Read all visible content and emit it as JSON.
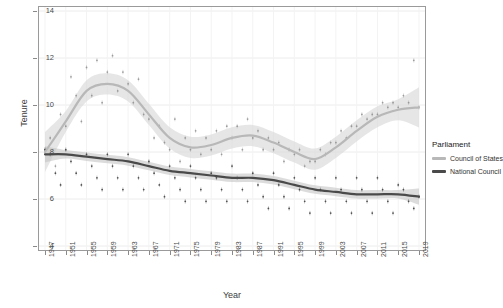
{
  "chart_data": {
    "type": "line",
    "title": "",
    "xlabel": "Year",
    "ylabel": "Tenure",
    "ylim": [
      4,
      14
    ],
    "xlim": [
      1947,
      2019
    ],
    "grid": true,
    "legend_position": "right",
    "legend_title": "Parliament",
    "y_ticks": [
      "4",
      "6",
      "8",
      "10",
      "12",
      "14"
    ],
    "x_ticks": [
      "1947",
      "1951",
      "1955",
      "1959",
      "1963",
      "1967",
      "1971",
      "1975",
      "1979",
      "1983",
      "1987",
      "1991",
      "1995",
      "1999",
      "2003",
      "2007",
      "2011",
      "2015",
      "2019"
    ],
    "series": [
      {
        "name": "Council of States",
        "color": "#b8b8b8",
        "band_color": "#d8d8d8",
        "x": [
          1947,
          1951,
          1955,
          1959,
          1963,
          1967,
          1971,
          1975,
          1979,
          1983,
          1987,
          1991,
          1995,
          1999,
          2003,
          2007,
          2011,
          2015,
          2019
        ],
        "values": [
          8.0,
          9.3,
          10.6,
          10.9,
          10.6,
          9.6,
          8.6,
          8.2,
          8.3,
          8.6,
          8.7,
          8.4,
          8.0,
          7.7,
          8.2,
          8.9,
          9.5,
          9.8,
          9.9
        ]
      },
      {
        "name": "National Council",
        "color": "#4a4a4a",
        "band_color": "#c0c0c0",
        "x": [
          1947,
          1951,
          1955,
          1959,
          1963,
          1967,
          1971,
          1975,
          1979,
          1983,
          1987,
          1991,
          1995,
          1999,
          2003,
          2007,
          2011,
          2015,
          2019
        ],
        "values": [
          7.9,
          7.9,
          7.8,
          7.7,
          7.6,
          7.4,
          7.2,
          7.1,
          7.0,
          6.9,
          6.9,
          6.8,
          6.6,
          6.4,
          6.3,
          6.2,
          6.2,
          6.2,
          6.1
        ]
      }
    ],
    "scatter": [
      {
        "series": "Council of States",
        "points": [
          [
            1947,
            8.1
          ],
          [
            1948,
            8.6
          ],
          [
            1949,
            7.4
          ],
          [
            1950,
            9.6
          ],
          [
            1951,
            9.1
          ],
          [
            1952,
            11.2
          ],
          [
            1953,
            10.4
          ],
          [
            1954,
            9.3
          ],
          [
            1955,
            11.6
          ],
          [
            1956,
            10.4
          ],
          [
            1957,
            11.9
          ],
          [
            1958,
            10.1
          ],
          [
            1959,
            11.4
          ],
          [
            1960,
            12.1
          ],
          [
            1961,
            10.6
          ],
          [
            1962,
            11.4
          ],
          [
            1963,
            10.9
          ],
          [
            1964,
            10.1
          ],
          [
            1965,
            11.1
          ],
          [
            1966,
            9.6
          ],
          [
            1967,
            9.4
          ],
          [
            1968,
            8.6
          ],
          [
            1969,
            9.1
          ],
          [
            1970,
            8.4
          ],
          [
            1971,
            8.1
          ],
          [
            1972,
            9.4
          ],
          [
            1973,
            7.6
          ],
          [
            1974,
            8.6
          ],
          [
            1975,
            8.1
          ],
          [
            1976,
            8.9
          ],
          [
            1977,
            7.9
          ],
          [
            1978,
            8.6
          ],
          [
            1979,
            8.1
          ],
          [
            1980,
            8.9
          ],
          [
            1981,
            7.9
          ],
          [
            1982,
            9.1
          ],
          [
            1983,
            8.6
          ],
          [
            1984,
            9.1
          ],
          [
            1985,
            8.1
          ],
          [
            1986,
            9.4
          ],
          [
            1987,
            8.6
          ],
          [
            1988,
            8.9
          ],
          [
            1989,
            8.1
          ],
          [
            1990,
            8.6
          ],
          [
            1991,
            8.1
          ],
          [
            1992,
            8.4
          ],
          [
            1993,
            7.6
          ],
          [
            1994,
            8.1
          ],
          [
            1995,
            7.9
          ],
          [
            1996,
            8.1
          ],
          [
            1997,
            7.4
          ],
          [
            1998,
            7.6
          ],
          [
            1999,
            7.6
          ],
          [
            2000,
            8.1
          ],
          [
            2001,
            7.9
          ],
          [
            2002,
            8.4
          ],
          [
            2003,
            8.4
          ],
          [
            2004,
            8.9
          ],
          [
            2005,
            8.6
          ],
          [
            2006,
            9.1
          ],
          [
            2007,
            9.1
          ],
          [
            2008,
            9.6
          ],
          [
            2009,
            9.4
          ],
          [
            2010,
            9.6
          ],
          [
            2011,
            9.6
          ],
          [
            2012,
            10.1
          ],
          [
            2013,
            9.9
          ],
          [
            2014,
            10.1
          ],
          [
            2015,
            9.9
          ],
          [
            2016,
            10.4
          ],
          [
            2017,
            10.1
          ],
          [
            2018,
            11.9
          ],
          [
            2019,
            9.9
          ]
        ]
      },
      {
        "series": "National Council",
        "points": [
          [
            1947,
            8.1
          ],
          [
            1948,
            7.9
          ],
          [
            1949,
            7.1
          ],
          [
            1950,
            6.6
          ],
          [
            1951,
            8.1
          ],
          [
            1952,
            7.6
          ],
          [
            1953,
            7.1
          ],
          [
            1954,
            6.6
          ],
          [
            1955,
            7.9
          ],
          [
            1956,
            7.4
          ],
          [
            1957,
            6.9
          ],
          [
            1958,
            6.4
          ],
          [
            1959,
            7.9
          ],
          [
            1960,
            7.4
          ],
          [
            1961,
            6.9
          ],
          [
            1962,
            6.4
          ],
          [
            1963,
            7.9
          ],
          [
            1964,
            7.4
          ],
          [
            1965,
            6.9
          ],
          [
            1966,
            6.4
          ],
          [
            1967,
            7.6
          ],
          [
            1968,
            7.1
          ],
          [
            1969,
            6.6
          ],
          [
            1970,
            6.1
          ],
          [
            1971,
            7.4
          ],
          [
            1972,
            6.9
          ],
          [
            1973,
            6.4
          ],
          [
            1974,
            5.9
          ],
          [
            1975,
            7.4
          ],
          [
            1976,
            6.9
          ],
          [
            1977,
            6.4
          ],
          [
            1978,
            5.9
          ],
          [
            1979,
            7.1
          ],
          [
            1980,
            6.9
          ],
          [
            1981,
            6.4
          ],
          [
            1982,
            5.9
          ],
          [
            1983,
            7.4
          ],
          [
            1984,
            6.9
          ],
          [
            1985,
            6.4
          ],
          [
            1986,
            5.9
          ],
          [
            1987,
            7.1
          ],
          [
            1988,
            6.6
          ],
          [
            1989,
            6.1
          ],
          [
            1990,
            5.6
          ],
          [
            1991,
            7.1
          ],
          [
            1992,
            6.6
          ],
          [
            1993,
            6.1
          ],
          [
            1994,
            5.6
          ],
          [
            1995,
            6.9
          ],
          [
            1996,
            6.4
          ],
          [
            1997,
            5.9
          ],
          [
            1998,
            5.4
          ],
          [
            1999,
            6.9
          ],
          [
            2000,
            6.4
          ],
          [
            2001,
            5.9
          ],
          [
            2002,
            5.4
          ],
          [
            2003,
            6.9
          ],
          [
            2004,
            6.4
          ],
          [
            2005,
            5.9
          ],
          [
            2006,
            5.4
          ],
          [
            2007,
            6.9
          ],
          [
            2008,
            6.4
          ],
          [
            2009,
            5.9
          ],
          [
            2010,
            5.4
          ],
          [
            2011,
            6.9
          ],
          [
            2012,
            6.4
          ],
          [
            2013,
            5.9
          ],
          [
            2014,
            5.4
          ],
          [
            2015,
            6.6
          ],
          [
            2016,
            6.4
          ],
          [
            2017,
            5.9
          ],
          [
            2018,
            5.6
          ],
          [
            2019,
            6.1
          ]
        ]
      }
    ]
  }
}
